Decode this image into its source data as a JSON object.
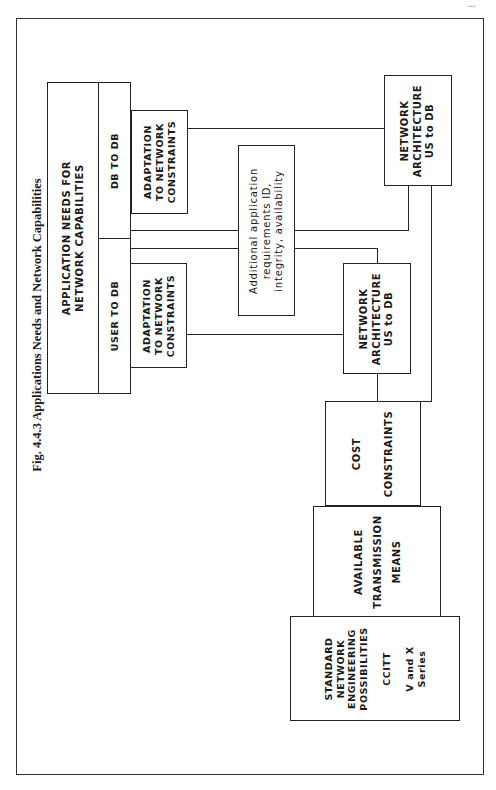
{
  "page": {
    "page_number_fragment": "..."
  },
  "figure": {
    "title": "Fig. 4.4.3  Applications Needs and Network Capabilities",
    "orientation": "rotated 90° counter-clockwise"
  },
  "nodes": {
    "app_needs": {
      "label": "APPLICATION NEEDS FOR\nNETWORK CAPABILITIES"
    },
    "db_to_db": {
      "label": "DB TO DB"
    },
    "user_to_db": {
      "label": "USER TO DB"
    },
    "adapt_db": {
      "label": "ADAPTATION\nTO NETWORK\nCONSTRAINTS"
    },
    "adapt_user": {
      "label": "ADAPTATION\nTO NETWORK\nCONSTRAINTS"
    },
    "additional": {
      "label": "Additional application\nrequirements ID,\nintegrity, availability"
    },
    "net_arch_1": {
      "label": "NETWORK\nARCHITECTURE\nUS to DB"
    },
    "net_arch_2": {
      "label": "NETWORK\nARCHITECTURE\nUS to DB"
    },
    "cost": {
      "label": "COST\n\nCONSTRAINTS"
    },
    "available": {
      "label": "AVAILABLE\nTRANSMISSION\nMEANS"
    },
    "standard": {
      "label": "STANDARD\nNETWORK\nENGINEERING\nPOSSIBILITIES\n\nCCITT\n\nV and X\nSeries"
    }
  },
  "edges": [
    {
      "from": "adapt_db",
      "to": "net_arch_1"
    },
    {
      "from": "db_to_db",
      "to": "additional"
    },
    {
      "from": "user_to_db",
      "to": "additional"
    },
    {
      "from": "additional",
      "to": "net_arch_1"
    },
    {
      "from": "additional",
      "to": "net_arch_2"
    },
    {
      "from": "adapt_user",
      "to": "net_arch_2"
    },
    {
      "from": "net_arch_2",
      "to": "cost"
    },
    {
      "from": "net_arch_1",
      "to": "cost"
    }
  ]
}
